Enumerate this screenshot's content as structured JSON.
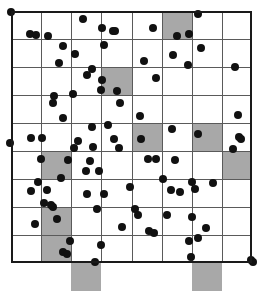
{
  "figure": {
    "title": "",
    "type": "spatial-point-pattern-quadrat-map"
  },
  "chart_data": {
    "type": "scatter",
    "title": "",
    "xlabel": "",
    "ylabel": "",
    "xlim": [
      0,
      8
    ],
    "ylim": [
      0,
      9
    ],
    "grid": true,
    "legend": null,
    "colors": {
      "point": "#111111",
      "grid_line": "#5a5a5a",
      "frame": "#1a1a1a",
      "shaded_cell": "#a8a8a8",
      "background": "#ffffff"
    },
    "grid_spec": {
      "columns": 8,
      "rows": 9,
      "cell_width_units": 1,
      "cell_height_units": 1,
      "x_ticks": [
        0,
        1,
        2,
        3,
        4,
        5,
        6,
        7,
        8
      ],
      "y_ticks": [
        0,
        1,
        2,
        3,
        4,
        5,
        6,
        7,
        8,
        9
      ]
    },
    "shaded_cells": [
      {
        "col": 5,
        "row": 0
      },
      {
        "col": 3,
        "row": 2
      },
      {
        "col": 4,
        "row": 4
      },
      {
        "col": 6,
        "row": 4
      },
      {
        "col": 1,
        "row": 5
      },
      {
        "col": 7,
        "row": 5
      },
      {
        "col": 1,
        "row": 7
      },
      {
        "col": 1,
        "row": 8
      },
      {
        "col": 2,
        "row": 9
      },
      {
        "col": 6,
        "row": 9
      }
    ],
    "point_count": 104,
    "points": [
      [
        0.0,
        0.02
      ],
      [
        2.38,
        0.3
      ],
      [
        3.02,
        0.62
      ],
      [
        3.38,
        0.7
      ],
      [
        3.45,
        0.72
      ],
      [
        4.72,
        0.62
      ],
      [
        6.2,
        0.12
      ],
      [
        0.62,
        0.82
      ],
      [
        0.82,
        0.84
      ],
      [
        1.22,
        0.88
      ],
      [
        5.5,
        0.9
      ],
      [
        5.92,
        0.82
      ],
      [
        1.72,
        1.26
      ],
      [
        3.08,
        1.22
      ],
      [
        6.3,
        1.32
      ],
      [
        2.12,
        1.52
      ],
      [
        5.38,
        1.58
      ],
      [
        1.58,
        1.86
      ],
      [
        4.42,
        1.78
      ],
      [
        5.88,
        1.92
      ],
      [
        2.7,
        2.08
      ],
      [
        2.52,
        2.28
      ],
      [
        7.42,
        2.0
      ],
      [
        3.02,
        2.46
      ],
      [
        4.82,
        2.4
      ],
      [
        3.0,
        2.82
      ],
      [
        3.52,
        2.86
      ],
      [
        1.42,
        3.02
      ],
      [
        2.06,
        2.98
      ],
      [
        1.4,
        3.3
      ],
      [
        3.62,
        3.3
      ],
      [
        1.72,
        3.82
      ],
      [
        4.28,
        3.74
      ],
      [
        7.52,
        3.72
      ],
      [
        2.68,
        4.16
      ],
      [
        3.22,
        4.08
      ],
      [
        5.34,
        4.22
      ],
      [
        6.22,
        4.4
      ],
      [
        0.66,
        4.52
      ],
      [
        1.02,
        4.52
      ],
      [
        -0.02,
        4.72
      ],
      [
        2.22,
        4.66
      ],
      [
        3.42,
        4.58
      ],
      [
        4.3,
        4.56
      ],
      [
        7.58,
        4.5
      ],
      [
        7.62,
        4.58
      ],
      [
        2.1,
        4.9
      ],
      [
        2.72,
        4.86
      ],
      [
        3.58,
        4.88
      ],
      [
        7.38,
        4.92
      ],
      [
        0.98,
        5.3
      ],
      [
        1.9,
        5.32
      ],
      [
        2.62,
        5.36
      ],
      [
        4.54,
        5.3
      ],
      [
        4.82,
        5.28
      ],
      [
        5.46,
        5.32
      ],
      [
        2.48,
        5.72
      ],
      [
        2.92,
        5.7
      ],
      [
        1.66,
        5.96
      ],
      [
        0.88,
        6.12
      ],
      [
        5.04,
        6.0
      ],
      [
        6.0,
        6.12
      ],
      [
        6.7,
        6.16
      ],
      [
        0.68,
        6.42
      ],
      [
        1.18,
        6.4
      ],
      [
        3.96,
        6.28
      ],
      [
        5.32,
        6.4
      ],
      [
        5.6,
        6.48
      ],
      [
        2.52,
        6.52
      ],
      [
        3.1,
        6.54
      ],
      [
        6.12,
        6.36
      ],
      [
        1.08,
        6.86
      ],
      [
        1.34,
        6.94
      ],
      [
        1.4,
        7.0
      ],
      [
        2.86,
        7.06
      ],
      [
        4.1,
        7.06
      ],
      [
        4.22,
        7.28
      ],
      [
        1.52,
        7.42
      ],
      [
        5.18,
        7.3
      ],
      [
        6.0,
        7.34
      ],
      [
        0.8,
        7.62
      ],
      [
        3.68,
        7.7
      ],
      [
        4.58,
        7.86
      ],
      [
        4.74,
        7.92
      ],
      [
        6.46,
        7.74
      ],
      [
        1.96,
        8.22
      ],
      [
        3.0,
        8.36
      ],
      [
        5.92,
        8.22
      ],
      [
        6.22,
        8.12
      ],
      [
        1.72,
        8.62
      ],
      [
        1.86,
        8.68
      ],
      [
        2.78,
        8.98
      ],
      [
        5.96,
        8.8
      ],
      [
        7.96,
        8.9
      ],
      [
        8.02,
        8.98
      ]
    ]
  }
}
